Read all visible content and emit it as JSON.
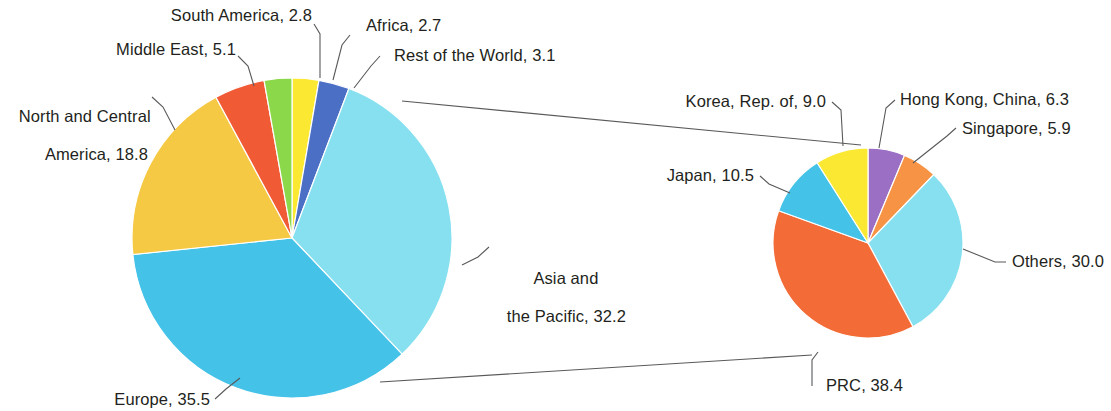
{
  "chart_data": [
    {
      "type": "pie",
      "name": "world-shares-pie",
      "title": "",
      "units": "percent share",
      "categories": [
        "Africa",
        "Rest of the World",
        "Asia and the Pacific",
        "Europe",
        "North and Central America",
        "Middle East",
        "South America"
      ],
      "values": [
        2.7,
        3.1,
        32.2,
        35.5,
        18.8,
        5.1,
        2.8
      ],
      "colors": [
        "#fbe832",
        "#4a6fc4",
        "#86e0ef",
        "#45c2e8",
        "#f6c945",
        "#f05a35",
        "#8bd94b"
      ],
      "labels": [
        "Africa, 2.7",
        "Rest of the World, 3.1",
        "Asia and\nthe Pacific, 32.2",
        "Europe, 35.5",
        "North and Central\nAmerica, 18.8",
        "Middle East, 5.1",
        "South America, 2.8"
      ],
      "start_angle_deg": 0,
      "direction": "clockwise",
      "legend": "none",
      "grid": false
    },
    {
      "type": "pie",
      "name": "asia-pacific-breakdown-pie",
      "title": "",
      "units": "percent share",
      "categories": [
        "Hong Kong, China",
        "Singapore",
        "Others",
        "PRC",
        "Japan",
        "Korea, Rep. of"
      ],
      "values": [
        6.3,
        5.9,
        30.0,
        38.4,
        10.5,
        9.0
      ],
      "colors": [
        "#9b6fc4",
        "#f79344",
        "#86e0ef",
        "#f36c37",
        "#45c2e8",
        "#fbe832"
      ],
      "labels": [
        "Hong Kong, China, 6.3",
        "Singapore, 5.9",
        "Others, 30.0",
        "PRC, 38.4",
        "Japan, 10.5",
        "Korea, Rep. of, 9.0"
      ],
      "start_angle_deg": 0,
      "direction": "clockwise",
      "legend": "none",
      "grid": false
    }
  ],
  "labels": {
    "south_america": "South America, 2.8",
    "africa": "Africa, 2.7",
    "middle_east": "Middle East, 5.1",
    "rest_of_world": "Rest of the World, 3.1",
    "north_central_america_line1": "North and Central",
    "north_central_america_line2": "America, 18.8",
    "asia_pacific_line1": "Asia and",
    "asia_pacific_line2": "the Pacific, 32.2",
    "europe": "Europe, 35.5",
    "korea": "Korea, Rep. of, 9.0",
    "hong_kong": "Hong Kong, China, 6.3",
    "singapore": "Singapore, 5.9",
    "japan": "Japan, 10.5",
    "others": "Others, 30.0",
    "prc": "PRC, 38.4"
  },
  "style": {
    "background": "#ffffff",
    "text_color": "#231f20",
    "leader_line_color": "#58595b"
  }
}
